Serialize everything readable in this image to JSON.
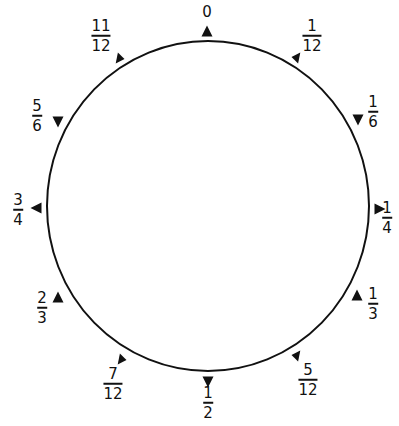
{
  "diagram": {
    "type": "circle-fraction-markers",
    "circle": {
      "cx": 208,
      "cy": 206,
      "rx": 161,
      "ry": 165,
      "stroke": "#111111",
      "stroke_width": 2
    },
    "marker_color": "#111111",
    "labels": [
      {
        "id": "0",
        "whole": "0",
        "x": 207,
        "y": 12,
        "tri": {
          "x": 207,
          "y": 31,
          "dir": "up"
        }
      },
      {
        "id": "1-12",
        "num": "1",
        "den": "12",
        "x": 312,
        "y": 36,
        "tri": {
          "x": 297,
          "y": 58,
          "dir": "upleft"
        }
      },
      {
        "id": "1-6",
        "num": "1",
        "den": "6",
        "x": 373,
        "y": 112,
        "tri": {
          "x": 358,
          "y": 120,
          "dir": "down"
        }
      },
      {
        "id": "1-4",
        "num": "1",
        "den": "4",
        "x": 387,
        "y": 218,
        "tri": {
          "x": 380,
          "y": 209,
          "dir": "right"
        }
      },
      {
        "id": "1-3",
        "num": "1",
        "den": "3",
        "x": 373,
        "y": 304,
        "tri": {
          "x": 357,
          "y": 295,
          "dir": "up"
        }
      },
      {
        "id": "5-12",
        "num": "5",
        "den": "12",
        "x": 308,
        "y": 380,
        "tri": {
          "x": 297,
          "y": 356,
          "dir": "upleft"
        }
      },
      {
        "id": "1-2",
        "num": "1",
        "den": "2",
        "x": 208,
        "y": 403,
        "tri": {
          "x": 208,
          "y": 382,
          "dir": "down"
        }
      },
      {
        "id": "7-12",
        "num": "7",
        "den": "12",
        "x": 113,
        "y": 384,
        "tri": {
          "x": 121,
          "y": 359,
          "dir": "downright"
        }
      },
      {
        "id": "2-3",
        "num": "2",
        "den": "3",
        "x": 42,
        "y": 308,
        "tri": {
          "x": 58,
          "y": 297,
          "dir": "up"
        }
      },
      {
        "id": "3-4",
        "num": "3",
        "den": "4",
        "x": 18,
        "y": 210,
        "tri": {
          "x": 36,
          "y": 208,
          "dir": "left"
        }
      },
      {
        "id": "5-6",
        "num": "5",
        "den": "6",
        "x": 37,
        "y": 116,
        "tri": {
          "x": 58,
          "y": 122,
          "dir": "down"
        }
      },
      {
        "id": "11-12",
        "num": "11",
        "den": "12",
        "x": 101,
        "y": 36,
        "tri": {
          "x": 119,
          "y": 58,
          "dir": "downright"
        }
      }
    ]
  }
}
